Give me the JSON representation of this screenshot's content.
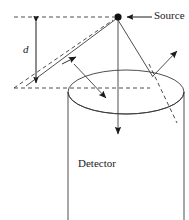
{
  "figure": {
    "type": "scientific-diagram",
    "background_color": "#ffffff",
    "stroke_color": "#3a3a3a",
    "solid_color": "#1a1a1a",
    "labels": {
      "source": "Source",
      "distance": "d",
      "detector": "Detector"
    },
    "geometry": {
      "source_point": [
        118,
        17
      ],
      "dashed_top_line": [
        14,
        17,
        118,
        17
      ],
      "dashed_bottom_line": [
        14,
        88,
        150,
        88
      ],
      "distance_arrow_x": 36,
      "distance_arrow_top_y": 17,
      "distance_arrow_bottom_y": 88,
      "ellipse_center": [
        126,
        92
      ],
      "ellipse_rx": 58,
      "ellipse_ry": 22,
      "cylinder_left_x": 68,
      "cylinder_right_x": 184,
      "cylinder_bottom_y": 220,
      "scatter_point": [
        153,
        76
      ],
      "leader_arrow_source": [
        152,
        17,
        128,
        17
      ]
    },
    "rays": [
      {
        "name": "oblique-ray-to-source",
        "from": [
          26,
          86
        ],
        "to": [
          118,
          17
        ],
        "style": "solid",
        "arrow": "mid-up-right"
      },
      {
        "name": "perpendicular-ray-into-detector",
        "from": [
          74,
          64
        ],
        "to": [
          110,
          101
        ],
        "style": "solid",
        "arrow": "end"
      },
      {
        "name": "axial-ray-down",
        "from": [
          118,
          20
        ],
        "to": [
          118,
          139
        ],
        "style": "solid",
        "arrow": "end"
      },
      {
        "name": "incident-ray-to-scatter",
        "from": [
          118,
          20
        ],
        "to": [
          153,
          76
        ],
        "style": "solid",
        "arrow": "none"
      },
      {
        "name": "scattered-ray-out",
        "from": [
          153,
          76
        ],
        "to": [
          180,
          50
        ],
        "style": "solid",
        "arrow": "end"
      },
      {
        "name": "transmitted-dashed-ray",
        "from": [
          149,
          65
        ],
        "to": [
          176,
          122
        ],
        "style": "dashed",
        "arrow": "none"
      },
      {
        "name": "dashed-hypotenuse",
        "from": [
          14,
          88
        ],
        "to": [
          112,
          21
        ],
        "style": "dashed",
        "arrow": "none"
      }
    ]
  }
}
